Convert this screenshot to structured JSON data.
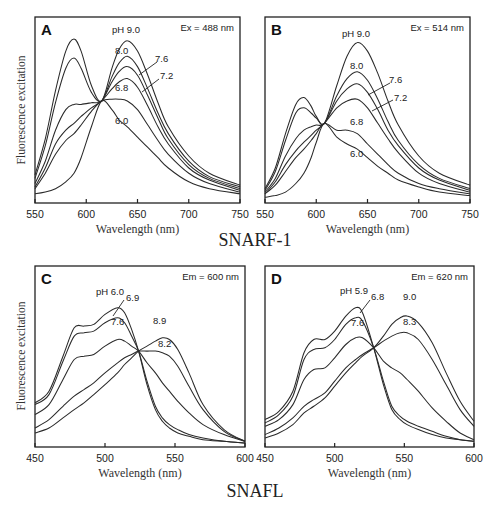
{
  "figure": {
    "group_titles": [
      {
        "text": "SNARF-1",
        "x": 255,
        "y": 246
      },
      {
        "text": "SNAFL",
        "x": 255,
        "y": 497
      }
    ],
    "ylabel": "Fluorescence excitation",
    "xlabel": "Wavelength (nm)"
  },
  "chart_data": [
    {
      "id": "A",
      "type": "line",
      "title": "A",
      "dye": "SNARF-1",
      "condition": "Ex = 488 nm",
      "xlabel": "Wavelength (nm)",
      "ylabel": "Fluorescence excitation",
      "xlim": [
        550,
        750
      ],
      "ylim": [
        0,
        100
      ],
      "xticks": [
        550,
        600,
        650,
        700,
        750
      ],
      "grid": false,
      "legend": "inline pH labels",
      "frame": {
        "left": 35,
        "top": 17,
        "right": 240,
        "bottom": 203
      },
      "x": [
        550,
        560,
        570,
        580,
        588,
        595,
        605,
        615,
        625,
        632,
        640,
        650,
        660,
        670,
        680,
        700,
        720,
        750
      ],
      "series": [
        {
          "name": "pH 9.0",
          "values": [
            14,
            35,
            63,
            86,
            93,
            86,
            66,
            57,
            76,
            87,
            92,
            86,
            72,
            56,
            42,
            25,
            15,
            8
          ]
        },
        {
          "name": "8.0",
          "values": [
            12,
            31,
            56,
            76,
            82,
            76,
            62,
            57,
            71,
            79,
            83,
            77,
            64,
            50,
            38,
            22,
            13,
            7
          ]
        },
        {
          "name": "7.6",
          "values": [
            9,
            22,
            40,
            52,
            55,
            55,
            56,
            57,
            68,
            74,
            77,
            72,
            60,
            47,
            35,
            20,
            12,
            6
          ]
        },
        {
          "name": "7.2",
          "values": [
            7,
            18,
            32,
            40,
            44,
            48,
            53,
            57,
            64,
            68,
            70,
            65,
            54,
            42,
            32,
            18,
            11,
            5
          ]
        },
        {
          "name": "6.8",
          "values": [
            6,
            15,
            26,
            34,
            38,
            43,
            51,
            57,
            58,
            58,
            57,
            52,
            43,
            34,
            26,
            15,
            9,
            4
          ]
        },
        {
          "name": "6.0",
          "values": [
            3,
            4,
            6,
            10,
            15,
            24,
            42,
            57,
            52,
            46,
            42,
            36,
            30,
            24,
            18,
            10,
            6,
            3
          ]
        }
      ],
      "labels": [
        {
          "text": "pH 9.0",
          "x": 112,
          "y": 33
        },
        {
          "text": "8.0",
          "x": 115,
          "y": 54
        },
        {
          "text": "7.6",
          "x": 155,
          "y": 62
        },
        {
          "text": "7.2",
          "x": 160,
          "y": 79
        },
        {
          "text": "6.8",
          "x": 115,
          "y": 91
        },
        {
          "text": "6.0",
          "x": 115,
          "y": 124
        }
      ],
      "leaders": [
        {
          "x1": 139,
          "y1": 75,
          "x2": 157,
          "y2": 62
        },
        {
          "x1": 142,
          "y1": 92,
          "x2": 159,
          "y2": 79
        }
      ]
    },
    {
      "id": "B",
      "type": "line",
      "title": "B",
      "dye": "SNARF-1",
      "condition": "Ex = 514 nm",
      "xlabel": "Wavelength (nm)",
      "ylabel": "",
      "xlim": [
        550,
        750
      ],
      "ylim": [
        0,
        100
      ],
      "xticks": [
        550,
        600,
        650,
        700,
        750
      ],
      "grid": false,
      "legend": "inline pH labels",
      "frame": {
        "left": 265,
        "top": 17,
        "right": 470,
        "bottom": 203
      },
      "x": [
        550,
        560,
        570,
        580,
        588,
        595,
        600,
        608,
        620,
        630,
        640,
        650,
        660,
        670,
        680,
        700,
        720,
        750
      ],
      "series": [
        {
          "name": "pH 9.0",
          "values": [
            6,
            18,
            38,
            55,
            59,
            54,
            48,
            44,
            66,
            83,
            91,
            86,
            73,
            57,
            43,
            25,
            15,
            8
          ]
        },
        {
          "name": "8.0",
          "values": [
            5,
            16,
            34,
            50,
            53,
            50,
            47,
            44,
            60,
            70,
            74,
            69,
            58,
            45,
            34,
            20,
            12,
            6
          ]
        },
        {
          "name": "7.6",
          "values": [
            4,
            12,
            25,
            35,
            40,
            42,
            43,
            44,
            57,
            64,
            67,
            62,
            52,
            40,
            31,
            18,
            11,
            5
          ]
        },
        {
          "name": "7.2",
          "values": [
            3,
            10,
            20,
            28,
            33,
            37,
            40,
            44,
            53,
            57,
            58,
            53,
            44,
            35,
            27,
            15,
            9,
            4
          ]
        },
        {
          "name": "6.8",
          "values": [
            3,
            8,
            16,
            24,
            29,
            34,
            38,
            44,
            40,
            40,
            38,
            32,
            26,
            20,
            15,
            9,
            6,
            3
          ]
        },
        {
          "name": "6.0",
          "values": [
            1,
            2,
            4,
            9,
            15,
            24,
            33,
            44,
            36,
            32,
            29,
            24,
            19,
            15,
            11,
            7,
            4,
            2
          ]
        }
      ],
      "labels": [
        {
          "text": "pH 9.0",
          "x": 342,
          "y": 37
        },
        {
          "text": "8.0",
          "x": 350,
          "y": 69
        },
        {
          "text": "7.6",
          "x": 389,
          "y": 83
        },
        {
          "text": "7.2",
          "x": 394,
          "y": 101
        },
        {
          "text": "6.8",
          "x": 350,
          "y": 125
        },
        {
          "text": "6.0",
          "x": 350,
          "y": 157
        }
      ],
      "leaders": [
        {
          "x1": 368,
          "y1": 95,
          "x2": 390,
          "y2": 83
        },
        {
          "x1": 372,
          "y1": 111,
          "x2": 393,
          "y2": 100
        }
      ]
    },
    {
      "id": "C",
      "type": "line",
      "title": "C",
      "dye": "SNAFL",
      "condition": "Em = 600 nm",
      "xlabel": "Wavelength (nm)",
      "ylabel": "Fluorescence excitation",
      "xlim": [
        450,
        600
      ],
      "ylim": [
        0,
        100
      ],
      "xticks": [
        450,
        500,
        550,
        600
      ],
      "grid": false,
      "legend": "inline pH labels",
      "frame": {
        "left": 35,
        "top": 266,
        "right": 245,
        "bottom": 447
      },
      "x": [
        450,
        460,
        470,
        478,
        485,
        492,
        500,
        509,
        514,
        519,
        524,
        530,
        536,
        541,
        546,
        552,
        560,
        570,
        585,
        600
      ],
      "series": [
        {
          "name": "pH 6.0",
          "values": [
            24,
            31,
            52,
            69,
            70,
            71,
            77,
            81,
            78,
            68,
            55,
            35,
            20,
            13,
            9,
            6,
            4,
            2,
            1,
            0
          ]
        },
        {
          "name": "6.9",
          "values": [
            23,
            29,
            49,
            64,
            66,
            67,
            72,
            75,
            72,
            64,
            55,
            37,
            22,
            15,
            11,
            8,
            5,
            3,
            1,
            0
          ]
        },
        {
          "name": "7.6",
          "values": [
            17,
            23,
            38,
            50,
            52,
            53,
            58,
            62,
            61,
            58,
            55,
            48,
            42,
            36,
            31,
            25,
            18,
            11,
            5,
            1
          ]
        },
        {
          "name": "8.2",
          "values": [
            9,
            14,
            22,
            28,
            32,
            36,
            42,
            48,
            51,
            53,
            55,
            55,
            55,
            54,
            52,
            46,
            34,
            20,
            7,
            1
          ]
        },
        {
          "name": "8.9",
          "values": [
            6,
            9,
            15,
            20,
            24,
            29,
            35,
            42,
            47,
            51,
            55,
            58,
            61,
            63,
            62,
            56,
            42,
            23,
            8,
            1
          ]
        }
      ],
      "labels": [
        {
          "text": "pH 6.0",
          "x": 96,
          "y": 295
        },
        {
          "text": "6.9",
          "x": 126,
          "y": 301
        },
        {
          "text": "7.6",
          "x": 111,
          "y": 325
        },
        {
          "text": "8.9",
          "x": 153,
          "y": 324
        },
        {
          "text": "8.2",
          "x": 158,
          "y": 347
        }
      ],
      "leaders": [
        {
          "x1": 113,
          "y1": 316,
          "x2": 124,
          "y2": 300
        }
      ]
    },
    {
      "id": "D",
      "type": "line",
      "title": "D",
      "dye": "SNAFL",
      "condition": "Em = 620 nm",
      "xlabel": "Wavelength (nm)",
      "ylabel": "",
      "xlim": [
        450,
        600
      ],
      "ylim": [
        0,
        100
      ],
      "xticks": [
        450,
        500,
        550,
        600
      ],
      "grid": false,
      "legend": "inline pH labels",
      "frame": {
        "left": 265,
        "top": 266,
        "right": 474,
        "bottom": 447
      },
      "x": [
        450,
        460,
        470,
        478,
        485,
        493,
        500,
        508,
        515,
        520,
        528,
        535,
        541,
        547,
        552,
        560,
        570,
        580,
        590,
        600
      ],
      "series": [
        {
          "name": "pH 5.9",
          "values": [
            14,
            19,
            31,
            54,
            62,
            62,
            67,
            76,
            81,
            78,
            57,
            35,
            20,
            14,
            11,
            8,
            5,
            3,
            2,
            1
          ]
        },
        {
          "name": "6.8",
          "values": [
            12,
            17,
            28,
            50,
            56,
            57,
            62,
            71,
            75,
            73,
            57,
            37,
            22,
            16,
            13,
            10,
            7,
            4,
            2,
            1
          ]
        },
        {
          "name": "7.6",
          "values": [
            10,
            14,
            23,
            38,
            44,
            45,
            51,
            59,
            63,
            63,
            57,
            49,
            45,
            42,
            38,
            31,
            21,
            13,
            6,
            2
          ]
        },
        {
          "name": "8.3",
          "values": [
            5,
            9,
            15,
            22,
            26,
            30,
            37,
            45,
            50,
            53,
            57,
            61,
            64,
            66,
            66,
            62,
            50,
            35,
            20,
            10
          ]
        },
        {
          "name": "9.0",
          "values": [
            3,
            6,
            11,
            18,
            22,
            27,
            34,
            42,
            48,
            52,
            57,
            64,
            71,
            75,
            76,
            72,
            60,
            42,
            25,
            13
          ]
        }
      ],
      "labels": [
        {
          "text": "pH 5.9",
          "x": 340,
          "y": 294
        },
        {
          "text": "6.8",
          "x": 371,
          "y": 300
        },
        {
          "text": "9.0",
          "x": 403,
          "y": 300
        },
        {
          "text": "7.6",
          "x": 351,
          "y": 326
        },
        {
          "text": "8.3",
          "x": 403,
          "y": 325
        }
      ],
      "leaders": [
        {
          "x1": 360,
          "y1": 313,
          "x2": 370,
          "y2": 300
        }
      ]
    }
  ]
}
